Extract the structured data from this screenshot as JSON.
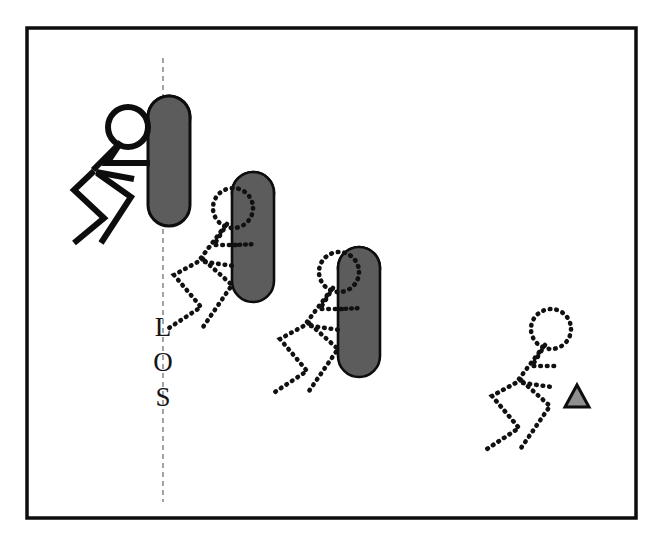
{
  "figure": {
    "caption": "",
    "frame": {
      "border_color": "#0d0d0d",
      "border_width": 3,
      "background": "#ffffff",
      "x": 27,
      "y": 28,
      "width": 609,
      "height": 490
    },
    "line_of_scrimmage": {
      "label_letters": [
        "L",
        "O",
        "S"
      ],
      "label_text": "LOS",
      "orientation": "vertical",
      "style": "dashed",
      "color": "#8d8d8d",
      "x": 163,
      "y_top": 58,
      "y_bottom": 502
    },
    "palette": {
      "ink": "#0d0d0d",
      "sled_body": "#5c5c5c",
      "sled_top": "#8f8f8f",
      "cone_fill": "#8f8f8f",
      "ghost": "#111111",
      "los_line": "#8d8d8d"
    },
    "players": [
      {
        "id": "player-1",
        "label": "lead blocker at line of scrimmage",
        "style": "solid",
        "stroke_width": 6,
        "head": {
          "cx": 128,
          "cy": 127,
          "r": 20
        },
        "has_sled": true,
        "sled": {
          "x": 148,
          "y": 96,
          "width": 42,
          "height": 130,
          "radius": 21
        }
      },
      {
        "id": "player-2",
        "label": "second position ghosted blocker",
        "style": "dotted",
        "stroke_width": 5,
        "head": {
          "cx": 233,
          "cy": 208,
          "r": 20
        },
        "has_sled": true,
        "sled": {
          "x": 232,
          "y": 172,
          "width": 42,
          "height": 130,
          "radius": 21
        }
      },
      {
        "id": "player-3",
        "label": "third position ghosted blocker",
        "style": "dotted",
        "stroke_width": 5,
        "head": {
          "cx": 339,
          "cy": 272,
          "r": 20
        },
        "has_sled": true,
        "sled": {
          "x": 338,
          "y": 247,
          "width": 42,
          "height": 130,
          "radius": 21
        }
      },
      {
        "id": "player-4",
        "label": "finish position ghosted player at cone",
        "style": "dotted",
        "stroke_width": 5,
        "head": {
          "cx": 551,
          "cy": 329,
          "r": 20
        },
        "has_sled": false,
        "sled": null
      }
    ],
    "cone": {
      "id": "target-cone",
      "label": "target cone",
      "x": 566,
      "y": 385,
      "width": 22,
      "height": 22,
      "fill": "#8f8f8f",
      "stroke": "#0d0d0d"
    }
  }
}
